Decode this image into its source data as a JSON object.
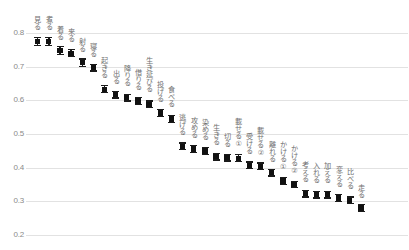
{
  "chart_data": {
    "type": "scatter",
    "title": "",
    "subtitle": "",
    "xlabel": "",
    "ylabel": "",
    "ylim": [
      0.17,
      0.83
    ],
    "yticks": [
      0.8,
      0.7,
      0.6,
      0.5,
      0.4,
      0.3,
      0.2
    ],
    "ytick_labels": [
      "0.8",
      "0.7",
      "0.6",
      "0.5",
      "0.4",
      "0.3",
      "0.2"
    ],
    "grid": true,
    "legend": "none",
    "error_bars": true,
    "categories": [
      "見る",
      "煮る",
      "着る",
      "来る",
      "射る",
      "寝る",
      "起きる",
      "出る",
      "降りる",
      "借りる",
      "生き延びる",
      "投げる",
      "食べる",
      "逃げる",
      "攻める",
      "染める",
      "生きる",
      "切る",
      "載せる①",
      "受ける",
      "載せる②",
      "離れる",
      "かける①",
      "かける②",
      "考える",
      "入れる",
      "加える",
      "変える",
      "比べる",
      "走る"
    ],
    "values": [
      0.775,
      0.775,
      0.748,
      0.74,
      0.712,
      0.697,
      0.633,
      0.617,
      0.608,
      0.598,
      0.588,
      0.562,
      0.545,
      0.463,
      0.455,
      0.45,
      0.433,
      0.43,
      0.428,
      0.407,
      0.404,
      0.385,
      0.36,
      0.35,
      0.323,
      0.32,
      0.32,
      0.31,
      0.303,
      0.28
    ],
    "errors": [
      0.012,
      0.012,
      0.011,
      0.011,
      0.011,
      0.01,
      0.01,
      0.01,
      0.01,
      0.01,
      0.01,
      0.01,
      0.011,
      0.01,
      0.01,
      0.01,
      0.01,
      0.01,
      0.01,
      0.01,
      0.01,
      0.01,
      0.01,
      0.01,
      0.01,
      0.01,
      0.01,
      0.01,
      0.01,
      0.01
    ]
  },
  "axis": {
    "y_tick_color": "#8a8a8a",
    "grid_color": "#e2e2e2"
  },
  "style": {
    "marker_color": "#111111",
    "label_color": "#6f6f6f",
    "background": "#ffffff"
  }
}
